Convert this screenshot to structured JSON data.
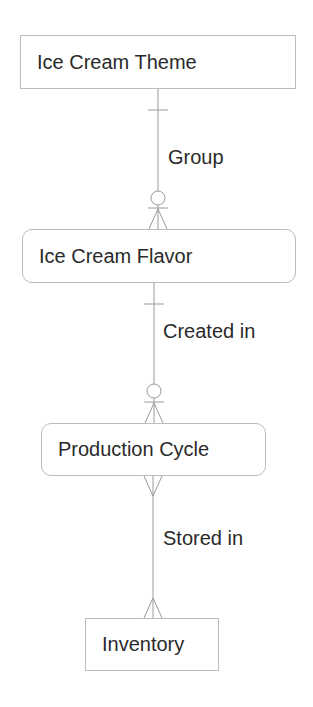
{
  "diagram": {
    "type": "er-diagram",
    "entities": [
      {
        "id": "theme",
        "label": "Ice Cream Theme",
        "shape": "rectangle"
      },
      {
        "id": "flavor",
        "label": "Ice Cream Flavor",
        "shape": "rounded"
      },
      {
        "id": "cycle",
        "label": "Production Cycle",
        "shape": "rounded"
      },
      {
        "id": "inventory",
        "label": "Inventory",
        "shape": "rectangle"
      }
    ],
    "relationships": [
      {
        "from": "theme",
        "to": "flavor",
        "label": "Group",
        "from_card": "one",
        "to_card": "zero-or-many"
      },
      {
        "from": "flavor",
        "to": "cycle",
        "label": "Created in",
        "from_card": "one",
        "to_card": "zero-or-many"
      },
      {
        "from": "cycle",
        "to": "inventory",
        "label": "Stored in",
        "from_card": "many",
        "to_card": "many"
      }
    ]
  }
}
